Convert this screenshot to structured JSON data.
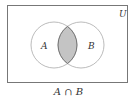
{
  "diagram": {
    "universe_label": "U",
    "set_a_label": "A",
    "set_b_label": "B",
    "caption": "A ∩ B",
    "shaded_region": "intersection",
    "colors": {
      "shade": "#c4c4c4",
      "stroke": "#666666",
      "circle_stroke": "#aaaaaa"
    }
  }
}
